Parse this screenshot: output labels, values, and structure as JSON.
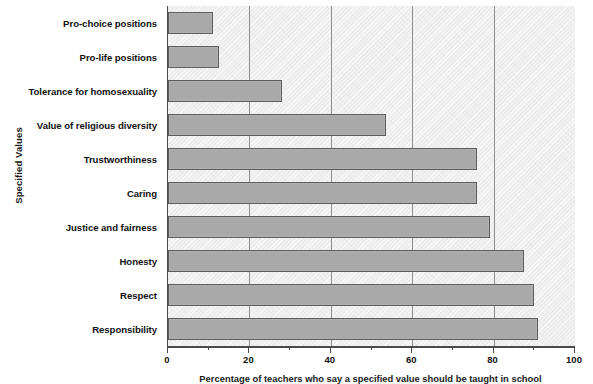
{
  "chart_data": {
    "type": "bar",
    "orientation": "horizontal",
    "title": "",
    "xlabel": "Percentage of teachers who say a specified value should be taught in school",
    "ylabel": "Specified Values",
    "xlim": [
      0,
      100
    ],
    "xticks": [
      0,
      20,
      40,
      60,
      80,
      100
    ],
    "xtick_labels": [
      "0",
      "20",
      "40",
      "60",
      "80",
      "100"
    ],
    "minor_tick_step": 10,
    "grid": "vertical",
    "legend": "none",
    "categories": [
      "Pro-choice positions",
      "Pro-life positions",
      "Tolerance for homosexuality",
      "Value of religious diversity",
      "Trustworthiness",
      "Caring",
      "Justice and fairness",
      "Honesty",
      "Respect",
      "Responsibility"
    ],
    "values": [
      11,
      12.5,
      28,
      53.5,
      76,
      76,
      79,
      87.5,
      90,
      91
    ],
    "bar_fill_color": "#a9a9a9",
    "bar_border_color": "#5c5c5c",
    "plot_background_color": "#eeeeee",
    "gridline_color": "#8d8d8d",
    "axis_color": "#4a4a4a"
  }
}
